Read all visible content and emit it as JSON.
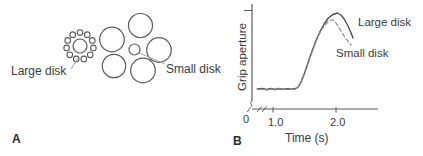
{
  "colors": {
    "stroke": "#5a5a5a",
    "solid_curve": "#4d4d4d",
    "dashed_curve": "#8c8c8c",
    "text": "#3a3a3a"
  },
  "figure": {
    "panel_a": {
      "letter": "A",
      "large_disk_label": "Large disk",
      "small_disk_label": "Small disk",
      "ebbinghaus": {
        "left": {
          "center": [
            80,
            46
          ],
          "center_radius": 7,
          "ring_radius": 13.5,
          "surround_count": 11,
          "surround_radius": 2.8
        },
        "right": {
          "center": [
            134.5,
            49.5
          ],
          "center_radius": 5.5,
          "surround": [
            [
              140.5,
              25.5,
              12.0
            ],
            [
              112.0,
              39.5,
              12.3
            ],
            [
              159.0,
              50.0,
              12.3
            ],
            [
              114.0,
              66.0,
              11.7
            ],
            [
              143.0,
              70.5,
              12.3
            ]
          ]
        }
      },
      "pointer_lines": {
        "large": [
          71,
          69,
          78,
          58
        ],
        "small": [
          139,
          53,
          165,
          64
        ]
      }
    },
    "panel_b": {
      "letter": "B",
      "ylabel": "Grip aperture",
      "xlabel": "Time (s)",
      "tick_0": "0",
      "tick_1": "1.0",
      "tick_2": "2.0",
      "large_disk_label": "Large disk",
      "small_disk_label": "Small disk",
      "axis_break": true
    }
  },
  "chart_data": {
    "type": "line",
    "title": "",
    "xlabel": "Time (s)",
    "ylabel": "Grip aperture",
    "xlim": [
      0,
      2.4
    ],
    "ylim": [
      0,
      100
    ],
    "x_axis_break_between": [
      0,
      1.0
    ],
    "x_tick_values": [
      1.0,
      2.0
    ],
    "x_tick_labels": [
      "0",
      "1.0",
      "2.0"
    ],
    "grid": false,
    "legend_position": "inline-annotations",
    "y_units": "arbitrary units",
    "series": [
      {
        "name": "Large disk",
        "style": "solid",
        "points": [
          [
            0.75,
            16
          ],
          [
            0.82,
            16.5
          ],
          [
            0.9,
            15.5
          ],
          [
            0.97,
            16.5
          ],
          [
            1.03,
            15.5
          ],
          [
            1.08,
            16.5
          ],
          [
            1.15,
            15.8
          ],
          [
            1.22,
            16.2
          ],
          [
            1.3,
            15.8
          ],
          [
            1.36,
            16.5
          ],
          [
            1.4,
            18
          ],
          [
            1.45,
            24
          ],
          [
            1.5,
            32
          ],
          [
            1.56,
            43
          ],
          [
            1.62,
            54
          ],
          [
            1.68,
            64
          ],
          [
            1.75,
            74
          ],
          [
            1.82,
            82
          ],
          [
            1.88,
            87
          ],
          [
            1.95,
            90.5
          ],
          [
            2.02,
            92
          ],
          [
            2.08,
            90
          ],
          [
            2.13,
            86
          ],
          [
            2.19,
            79
          ],
          [
            2.24,
            72
          ],
          [
            2.27,
            67
          ]
        ]
      },
      {
        "name": "Small disk",
        "style": "dashed",
        "points": [
          [
            0.75,
            15.5
          ],
          [
            0.82,
            16
          ],
          [
            0.9,
            15.2
          ],
          [
            0.97,
            16.2
          ],
          [
            1.03,
            15.2
          ],
          [
            1.08,
            16.2
          ],
          [
            1.15,
            15.5
          ],
          [
            1.22,
            16
          ],
          [
            1.3,
            15.5
          ],
          [
            1.36,
            16.2
          ],
          [
            1.4,
            17.5
          ],
          [
            1.45,
            23
          ],
          [
            1.5,
            31
          ],
          [
            1.56,
            42
          ],
          [
            1.62,
            53
          ],
          [
            1.68,
            63
          ],
          [
            1.75,
            73
          ],
          [
            1.81,
            79
          ],
          [
            1.87,
            83
          ],
          [
            1.92,
            85
          ],
          [
            1.95,
            85
          ],
          [
            2.0,
            82
          ],
          [
            2.05,
            77
          ],
          [
            2.1,
            72
          ],
          [
            2.15,
            67
          ],
          [
            2.2,
            63
          ],
          [
            2.24,
            60
          ]
        ]
      }
    ]
  }
}
